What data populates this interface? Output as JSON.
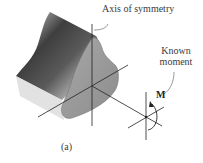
{
  "figure": {
    "label": "(a)",
    "annotations": {
      "axis_of_symmetry": "Axis of symmetry",
      "known_moment_line1": "Known",
      "known_moment_line2": "moment",
      "moment_symbol": "M"
    },
    "colors": {
      "beam_dark": "#4a4a4a",
      "beam_light": "#d8d8d8",
      "face": "#9a9a9a",
      "lines": "#222222",
      "text": "#3a3a3a"
    }
  }
}
